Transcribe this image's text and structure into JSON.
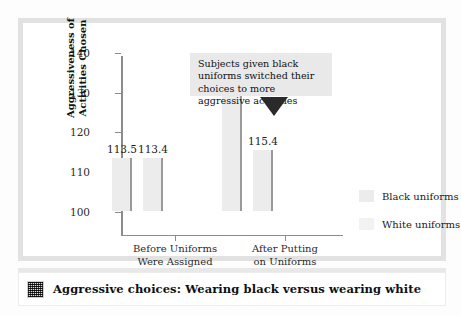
{
  "caption": {
    "icon": "pixel-thumbnail-icon",
    "text": "Aggressive choices: Wearing black versus wearing white"
  },
  "annotation": {
    "text": "Subjects given black uniforms switched their choices to more aggressive activities",
    "pointer": "down-triangle-icon"
  },
  "legend": {
    "items": [
      {
        "label": "Black uniforms",
        "color": "#ececec"
      },
      {
        "label": "White uniforms",
        "color": "#f2f2f2"
      }
    ]
  },
  "chart_data": {
    "type": "bar",
    "title": "",
    "xlabel": "Time Period When Activities Selected",
    "ylabel": "Aggressiveness of Activities Chosen",
    "ylabel_line1": "Aggressiveness of",
    "ylabel_line2": "Activities Chosen",
    "categories": [
      "Before Uniforms Were Assigned",
      "After Putting on Uniforms"
    ],
    "category_lines": [
      [
        "Before Uniforms",
        "Were Assigned"
      ],
      [
        "After Putting",
        "on Uniforms"
      ]
    ],
    "series": [
      {
        "name": "Black uniforms",
        "values": [
          113.5,
          130.3
        ]
      },
      {
        "name": "White uniforms",
        "values": [
          113.4,
          115.4
        ]
      }
    ],
    "value_labels": [
      "113.5",
      "113.4",
      "130.3",
      "115.4"
    ],
    "ylim": [
      100,
      145
    ],
    "yticks": [
      100,
      110,
      120,
      130,
      140
    ],
    "ytick_labels": [
      "100",
      "110",
      "120",
      "130",
      "140"
    ],
    "grid": false,
    "legend_position": "right",
    "bar_fill": "#ececec",
    "bar_edge": "#9a9a9a",
    "axis_color": "#8c8c8c"
  }
}
